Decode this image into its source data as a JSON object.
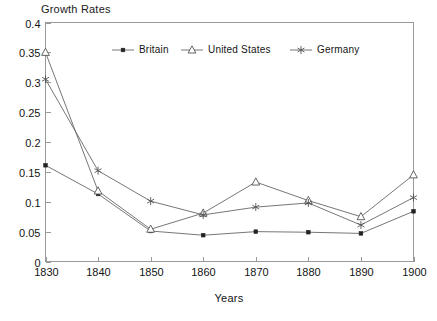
{
  "chart_data": {
    "type": "line",
    "title": "Growth Rates",
    "xlabel": "Years",
    "ylabel": "",
    "x": [
      1830,
      1840,
      1850,
      1860,
      1870,
      1880,
      1890,
      1900
    ],
    "xticklabels": [
      "1830",
      "1840",
      "1850",
      "1860",
      "1870",
      "1880",
      "1890",
      "1900"
    ],
    "yticklabels": [
      "0",
      "0.05",
      "0.1",
      "0.15",
      "0.2",
      "0.25",
      "0.3",
      "0.35",
      "0.4"
    ],
    "ytickvalues": [
      0,
      0.05,
      0.1,
      0.15,
      0.2,
      0.25,
      0.3,
      0.35,
      0.4
    ],
    "ylim": [
      0,
      0.4
    ],
    "xlim": [
      1830,
      1900
    ],
    "grid": false,
    "legend_position": "top-center-inside",
    "series": [
      {
        "name": "Britain",
        "marker": "square-filled",
        "values": [
          0.161,
          0.113,
          0.051,
          0.044,
          0.05,
          0.049,
          0.047,
          0.084
        ]
      },
      {
        "name": "United States",
        "marker": "triangle-open",
        "values": [
          0.35,
          0.118,
          0.054,
          0.081,
          0.133,
          0.102,
          0.075,
          0.145
        ]
      },
      {
        "name": "Germany",
        "marker": "asterisk",
        "values": [
          0.305,
          0.152,
          0.101,
          0.078,
          0.091,
          0.098,
          0.061,
          0.107
        ]
      }
    ]
  },
  "legend": {
    "items": [
      {
        "label": "Britain",
        "marker": "square-filled"
      },
      {
        "label": "United States",
        "marker": "triangle-open"
      },
      {
        "label": "Germany",
        "marker": "asterisk"
      }
    ]
  },
  "colors": {
    "background": "#ffffff",
    "frame": "#9a9a9a",
    "line": "#666666",
    "text": "#141414",
    "marker_fill": "#ffffff",
    "marker_solid": "#222222"
  }
}
